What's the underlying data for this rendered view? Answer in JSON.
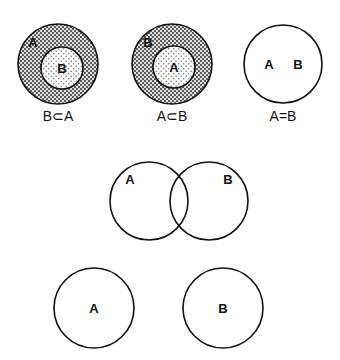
{
  "figure": {
    "background_color": "#ffffff",
    "stroke_color": "#111111",
    "fill_dark": "#b9b9b9",
    "fill_light": "#ededed",
    "diagrams": [
      {
        "id": "b-subset-a",
        "caption": "B⊂A",
        "outer_label": "A",
        "inner_label": "B"
      },
      {
        "id": "a-subset-b",
        "caption": "A⊂B",
        "outer_label": "B",
        "inner_label": "A"
      },
      {
        "id": "a-equals-b",
        "caption": "A=B",
        "left_label": "A",
        "right_label": "B"
      },
      {
        "id": "a-intersect-b",
        "caption": "",
        "left_label": "A",
        "right_label": "B"
      },
      {
        "id": "a-disjoint-b",
        "caption": "",
        "left_label": "A",
        "right_label": "B"
      }
    ]
  }
}
